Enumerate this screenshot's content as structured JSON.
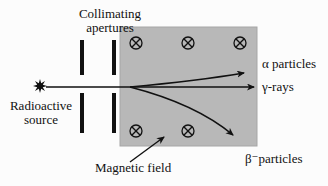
{
  "diagram": {
    "apertures_label": {
      "line1": "Collimating",
      "line2": "apertures"
    },
    "source_label": {
      "line1": "Radioactive",
      "line2": "source"
    },
    "field_label": "Magnetic field",
    "rays": {
      "alpha_label": "α particles",
      "gamma_label": "γ-rays",
      "beta_label": "β⁻particles"
    },
    "icons": {
      "field_into_page_symbol": "circled-cross-into-page",
      "source_symbol": "eight-point-star-burst",
      "arrowhead": "filled-triangle"
    },
    "colors": {
      "field_region": "#b8b8b8",
      "field_region_edge": "#a6a6a6",
      "ink": "#111111",
      "background": "#fcfcfc"
    }
  }
}
